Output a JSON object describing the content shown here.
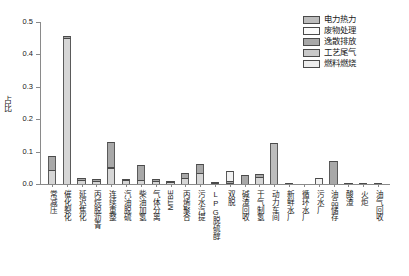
{
  "chart_data": {
    "type": "bar",
    "stacked": true,
    "title": "",
    "subtitle": "",
    "xlabel": "",
    "ylabel": "占比",
    "ylim": [
      0.0,
      0.5
    ],
    "ytick_labels": [
      "0.0",
      "0.1",
      "0.2",
      "0.3",
      "0.4",
      "0.5"
    ],
    "ytick_values": [
      0.0,
      0.1,
      0.2,
      0.3,
      0.4,
      0.5
    ],
    "grid": false,
    "legend_position": "top-right",
    "categories": [
      "常减压",
      "催化裂化",
      "延迟焦化",
      "丙烷脱沥青",
      "连续重整",
      "汽油脱硫",
      "柴油加氢",
      "气体分离",
      "MTBE",
      "丙烯聚合",
      "污水汽提",
      "LPG脱硫醇",
      "双脱",
      "碱渣回收",
      "干气制氢",
      "动力车间",
      "新鲜水厂",
      "循环水厂",
      "污水厂",
      "油品储存",
      "酸渣",
      "火炬",
      "油气回收"
    ],
    "series": [
      {
        "name": "燃料燃烧",
        "color": "#d6d6d6",
        "values": [
          0.044,
          0.452,
          0.013,
          0.009,
          0.048,
          0.012,
          0.013,
          0.01,
          0.006,
          0.02,
          0.034,
          0.002,
          0.003,
          0.0,
          0.022,
          0.0,
          0.0,
          0.0,
          0.0,
          0.0,
          0.0,
          0.0,
          0.0
        ]
      },
      {
        "name": "工艺尾气",
        "color": "#b8b8b8",
        "values": [
          0.0,
          0.0,
          0.0,
          0.0,
          0.004,
          0.0,
          0.0,
          0.0,
          0.0,
          0.0,
          0.0,
          0.0,
          0.0,
          0.0,
          0.0,
          0.0,
          0.0,
          0.0,
          0.0,
          0.0,
          0.0,
          0.0,
          0.0
        ]
      },
      {
        "name": "逸散排放",
        "color": "#a8a8a8",
        "values": [
          0.041,
          0.006,
          0.006,
          0.006,
          0.078,
          0.003,
          0.046,
          0.006,
          0.004,
          0.015,
          0.027,
          0.002,
          0.005,
          0.027,
          0.008,
          0.0,
          0.002,
          0.0,
          0.0,
          0.07,
          0.004,
          0.001,
          0.002
        ]
      },
      {
        "name": "废物处理",
        "color": "#f2f2f2",
        "values": [
          0.0,
          0.0,
          0.0,
          0.0,
          0.0,
          0.0,
          0.0,
          0.0,
          0.0,
          0.0,
          0.0,
          0.0,
          0.03,
          0.0,
          0.0,
          0.0,
          0.0,
          0.0,
          0.019,
          0.0,
          0.0,
          0.0,
          0.0
        ]
      },
      {
        "name": "电力热力",
        "color": "#bdbdbd",
        "values": [
          0.0,
          0.0,
          0.0,
          0.0,
          0.0,
          0.0,
          0.0,
          0.0,
          0.0,
          0.0,
          0.0,
          0.0,
          0.0,
          0.0,
          0.0,
          0.128,
          0.0,
          0.0,
          0.0,
          0.0,
          0.0,
          0.0,
          0.0
        ]
      }
    ],
    "totals": [
      0.085,
      0.458,
      0.019,
      0.015,
      0.13,
      0.015,
      0.059,
      0.016,
      0.01,
      0.035,
      0.061,
      0.004,
      0.038,
      0.027,
      0.03,
      0.128,
      0.002,
      0.0,
      0.019,
      0.07,
      0.004,
      0.001,
      0.002
    ]
  },
  "legend": {
    "items": [
      {
        "label": "电力热力",
        "color": "#bdbdbd"
      },
      {
        "label": "废物处理",
        "color": "#fbfbfb"
      },
      {
        "label": "逸散排放",
        "color": "#a8a8a8"
      },
      {
        "label": "工艺尾气",
        "color": "#c9c9c9"
      },
      {
        "label": "燃料燃烧",
        "color": "#ededed"
      }
    ]
  },
  "colors": {
    "axis": "#8a8a8a",
    "bar_outline": "#4a4a4a",
    "text": "#1a1a1a",
    "background": "#ffffff"
  }
}
